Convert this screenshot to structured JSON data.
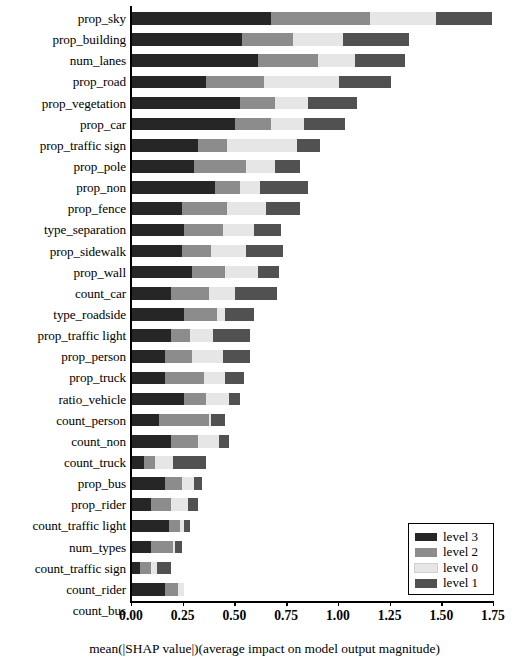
{
  "chart_data": {
    "type": "bar",
    "subtype": "horizontal-stacked",
    "title": "",
    "xlabel": "mean(|SHAP value|)(average impact on model output magnitude)",
    "ylabel": "",
    "xlim": [
      0.0,
      1.75
    ],
    "xticks": [
      0.0,
      0.25,
      0.5,
      0.75,
      1.0,
      1.25,
      1.5,
      1.75
    ],
    "xtick_labels": [
      "0.00",
      "0.25",
      "0.50",
      "0.75",
      "1.00",
      "1.25",
      "1.50",
      "1.75"
    ],
    "grid": false,
    "legend_position": "lower right",
    "categories": [
      "prop_sky",
      "prop_building",
      "num_lanes",
      "prop_road",
      "prop_vegetation",
      "prop_car",
      "prop_traffic sign",
      "prop_pole",
      "prop_non",
      "prop_fence",
      "type_separation",
      "prop_sidewalk",
      "prop_wall",
      "count_car",
      "type_roadside",
      "prop_traffic light",
      "prop_person",
      "prop_truck",
      "ratio_vehicle",
      "count_person",
      "count_non",
      "count_truck",
      "prop_bus",
      "prop_rider",
      "count_traffic light",
      "num_types",
      "count_traffic sign",
      "count_rider",
      "count_bus"
    ],
    "series": [
      {
        "name": "level 3",
        "color": "#262626",
        "values": [
          0.67,
          0.53,
          0.61,
          0.36,
          0.52,
          0.5,
          0.32,
          0.3,
          0.4,
          0.24,
          0.25,
          0.24,
          0.29,
          0.19,
          0.25,
          0.19,
          0.16,
          0.16,
          0.25,
          0.13,
          0.19,
          0.06,
          0.16,
          0.09,
          0.18,
          0.09,
          0.04,
          0.16,
          0.0
        ]
      },
      {
        "name": "level 2",
        "color": "#8c8c8c",
        "values": [
          0.48,
          0.25,
          0.29,
          0.28,
          0.17,
          0.17,
          0.14,
          0.25,
          0.12,
          0.22,
          0.19,
          0.14,
          0.16,
          0.18,
          0.16,
          0.09,
          0.13,
          0.19,
          0.11,
          0.24,
          0.13,
          0.05,
          0.08,
          0.1,
          0.05,
          0.11,
          0.05,
          0.06,
          0.0
        ]
      },
      {
        "name": "level 0",
        "color": "#e6e6e6",
        "values": [
          0.32,
          0.24,
          0.18,
          0.36,
          0.16,
          0.16,
          0.34,
          0.14,
          0.1,
          0.19,
          0.15,
          0.17,
          0.16,
          0.13,
          0.04,
          0.11,
          0.15,
          0.1,
          0.11,
          0.01,
          0.1,
          0.09,
          0.06,
          0.08,
          0.02,
          0.01,
          0.03,
          0.03,
          0.0
        ]
      },
      {
        "name": "level 1",
        "color": "#515151",
        "values": [
          0.27,
          0.32,
          0.24,
          0.25,
          0.24,
          0.2,
          0.11,
          0.12,
          0.23,
          0.16,
          0.13,
          0.18,
          0.1,
          0.2,
          0.14,
          0.18,
          0.13,
          0.09,
          0.05,
          0.07,
          0.05,
          0.16,
          0.04,
          0.05,
          0.03,
          0.03,
          0.07,
          0.0,
          0.0
        ]
      }
    ],
    "totals": [
      1.74,
      1.34,
      1.32,
      1.25,
      1.09,
      1.03,
      0.91,
      0.81,
      0.85,
      0.81,
      0.72,
      0.73,
      0.71,
      0.7,
      0.59,
      0.57,
      0.57,
      0.54,
      0.52,
      0.45,
      0.47,
      0.36,
      0.34,
      0.32,
      0.28,
      0.24,
      0.19,
      0.25,
      0.0
    ]
  },
  "legend": {
    "entries": [
      {
        "label": "level 3",
        "color": "#262626"
      },
      {
        "label": "level 2",
        "color": "#8c8c8c"
      },
      {
        "label": "level 0",
        "color": "#e6e6e6"
      },
      {
        "label": "level 1",
        "color": "#515151"
      }
    ]
  }
}
